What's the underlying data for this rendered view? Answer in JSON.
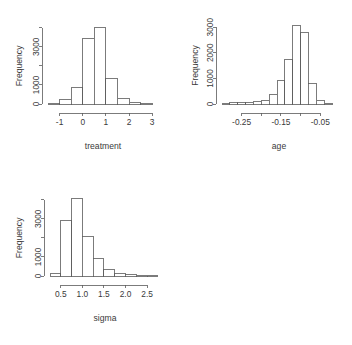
{
  "figure": {
    "background_color": "#ffffff",
    "line_color": "#5a5a5a",
    "text_color": "#3a3a3a",
    "bar_fill": "#ffffff",
    "layout": "2x2 grid, fourth cell empty"
  },
  "panels": [
    {
      "id": "treatment",
      "ylabel": "Frequency",
      "xlabel": "treatment",
      "y_ticks": [
        {
          "value": 0,
          "label": "0"
        },
        {
          "value": 1000,
          "label": "1000"
        },
        {
          "value": 2000,
          "label": ""
        },
        {
          "value": 3000,
          "label": "3000"
        },
        {
          "value": 4000,
          "label": ""
        }
      ],
      "x_ticks": [
        {
          "value": -1,
          "label": "-1"
        },
        {
          "value": 0,
          "label": "0"
        },
        {
          "value": 1,
          "label": "1"
        },
        {
          "value": 2,
          "label": "2"
        },
        {
          "value": 3,
          "label": "3"
        }
      ]
    },
    {
      "id": "age",
      "ylabel": "Frequency",
      "xlabel": "age",
      "y_ticks": [
        {
          "value": 0,
          "label": "0"
        },
        {
          "value": 1000,
          "label": "1000"
        },
        {
          "value": 2000,
          "label": "2000"
        },
        {
          "value": 3000,
          "label": "3000"
        }
      ],
      "x_ticks": [
        {
          "value": -0.25,
          "label": "-0.25"
        },
        {
          "value": -0.2,
          "label": ""
        },
        {
          "value": -0.15,
          "label": "-0.15"
        },
        {
          "value": -0.1,
          "label": ""
        },
        {
          "value": -0.05,
          "label": "-0.05"
        }
      ]
    },
    {
      "id": "sigma",
      "ylabel": "Frequency",
      "xlabel": "sigma",
      "y_ticks": [
        {
          "value": 0,
          "label": "0"
        },
        {
          "value": 1000,
          "label": "1000"
        },
        {
          "value": 2000,
          "label": ""
        },
        {
          "value": 3000,
          "label": "3000"
        },
        {
          "value": 4000,
          "label": ""
        }
      ],
      "x_ticks": [
        {
          "value": 0.5,
          "label": "0.5"
        },
        {
          "value": 1.0,
          "label": "1.0"
        },
        {
          "value": 1.5,
          "label": "1.5"
        },
        {
          "value": 2.0,
          "label": "2.0"
        },
        {
          "value": 2.5,
          "label": "2.5"
        }
      ]
    }
  ],
  "chart_data": [
    {
      "type": "bar",
      "id": "treatment-histogram",
      "title": "",
      "xlabel": "treatment",
      "ylabel": "Frequency",
      "xlim": [
        -1.5,
        3.25
      ],
      "ylim": [
        0,
        4300
      ],
      "grid": false,
      "legend": "none",
      "bin_width": 0.5,
      "bin_edges": [
        -1.5,
        -1.0,
        -0.5,
        0.0,
        0.5,
        1.0,
        1.5,
        2.0,
        2.5,
        3.0
      ],
      "categories": [
        "-1.5 to -1.0",
        "-1.0 to -0.5",
        "-0.5 to 0.0",
        "0.0 to 0.5",
        "0.5 to 1.0",
        "1.0 to 1.5",
        "1.5 to 2.0",
        "2.0 to 2.5",
        "2.5 to 3.0"
      ],
      "values": [
        20,
        220,
        880,
        3450,
        4000,
        1350,
        290,
        90,
        25
      ]
    },
    {
      "type": "bar",
      "id": "age-histogram",
      "title": "",
      "xlabel": "age",
      "ylabel": "Frequency",
      "xlim": [
        -0.3,
        -0.01
      ],
      "ylim": [
        0,
        3200
      ],
      "grid": false,
      "legend": "none",
      "bin_width": 0.02,
      "bin_edges": [
        -0.3,
        -0.28,
        -0.26,
        -0.24,
        -0.22,
        -0.2,
        -0.18,
        -0.16,
        -0.14,
        -0.12,
        -0.1,
        -0.08,
        -0.06,
        -0.04,
        -0.02
      ],
      "categories": [
        "-0.30 to -0.28",
        "-0.28 to -0.26",
        "-0.26 to -0.24",
        "-0.24 to -0.22",
        "-0.22 to -0.20",
        "-0.20 to -0.18",
        "-0.18 to -0.16",
        "-0.16 to -0.14",
        "-0.14 to -0.12",
        "-0.12 to -0.10",
        "-0.10 to -0.08",
        "-0.08 to -0.06",
        "-0.06 to -0.04",
        "-0.04 to -0.02"
      ],
      "values": [
        15,
        40,
        55,
        70,
        90,
        140,
        380,
        900,
        1750,
        3050,
        2800,
        800,
        150,
        30
      ]
    },
    {
      "type": "bar",
      "id": "sigma-histogram",
      "title": "",
      "xlabel": "sigma",
      "ylabel": "Frequency",
      "xlim": [
        0.25,
        2.8
      ],
      "ylim": [
        0,
        4300
      ],
      "grid": false,
      "legend": "none",
      "bin_width": 0.25,
      "bin_edges": [
        0.25,
        0.5,
        0.75,
        1.0,
        1.25,
        1.5,
        1.75,
        2.0,
        2.25,
        2.5,
        2.75
      ],
      "categories": [
        "0.25 to 0.50",
        "0.50 to 0.75",
        "0.75 to 1.00",
        "1.00 to 1.25",
        "1.25 to 1.50",
        "1.50 to 1.75",
        "1.75 to 2.00",
        "2.00 to 2.25",
        "2.25 to 2.50",
        "2.50 to 2.75"
      ],
      "values": [
        120,
        2900,
        4050,
        2050,
        900,
        320,
        150,
        60,
        25,
        10
      ]
    }
  ]
}
